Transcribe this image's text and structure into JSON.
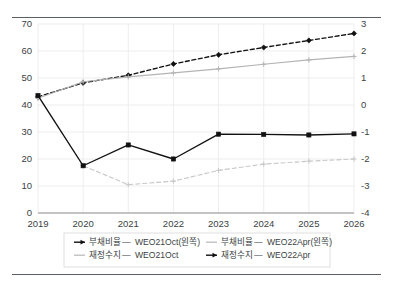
{
  "chart_data": {
    "type": "line",
    "title": "",
    "subtitle": "",
    "xlabel": "",
    "ylabel": "",
    "grid": true,
    "legend_position": "bottom",
    "categories": [
      "2019",
      "2020",
      "2021",
      "2022",
      "2023",
      "2024",
      "2025",
      "2026"
    ],
    "x": [
      2019,
      2020,
      2021,
      2022,
      2023,
      2024,
      2025,
      2026
    ],
    "left_axis": {
      "label": "",
      "ylim": [
        0,
        70
      ],
      "ticks": [
        "0",
        "10",
        "20",
        "30",
        "40",
        "50",
        "60",
        "70"
      ],
      "tick_values": [
        0,
        10,
        20,
        30,
        40,
        50,
        60,
        70
      ]
    },
    "right_axis": {
      "label": "",
      "ylim": [
        -4,
        3
      ],
      "ticks": [
        "-4",
        "-3",
        "-2",
        "-1",
        "0",
        "1",
        "2",
        "3"
      ],
      "tick_values": [
        -4,
        -3,
        -2,
        -1,
        0,
        1,
        2,
        3
      ]
    },
    "series": [
      {
        "name": "부채비율 WEO21Oct(왼쪽)",
        "axis": "left",
        "color": "#111111",
        "style": "dashed",
        "marker": "diamond",
        "values": [
          43.0,
          48.2,
          51.0,
          55.2,
          58.6,
          61.3,
          63.9,
          66.5
        ]
      },
      {
        "name": "부채비율 WEO22Apr(왼쪽)",
        "axis": "left",
        "color": "#b4b4b4",
        "style": "solid",
        "marker": "plus",
        "values": [
          42.5,
          48.6,
          50.4,
          51.9,
          53.4,
          55.1,
          56.7,
          58.0
        ]
      },
      {
        "name": "재정수지 WEO21Oct",
        "axis": "right",
        "color": "#c8c8c8",
        "style": "dashed",
        "marker": "plus",
        "values": [
          0.35,
          -2.25,
          -2.95,
          -2.82,
          -2.42,
          -2.19,
          -2.08,
          -2.0
        ]
      },
      {
        "name": "재정수지 WEO22Apr",
        "axis": "right",
        "color": "#111111",
        "style": "solid",
        "marker": "square",
        "values": [
          0.35,
          -2.25,
          -1.48,
          -2.0,
          -1.08,
          -1.09,
          -1.11,
          -1.07
        ]
      }
    ],
    "legend": [
      {
        "label_kr": "부채비율",
        "label_en": "WEO21Oct(왼쪽)",
        "marker": "arrow",
        "color": "#111111",
        "style": "solid"
      },
      {
        "label_kr": "부채비율",
        "label_en": "WEO22Apr(왼쪽)",
        "marker": "plus",
        "color": "#c0c0c0",
        "style": "solid"
      },
      {
        "label_kr": "재정수지",
        "label_en": "WEO21Oct",
        "marker": "dash",
        "color": "#c0c0c0",
        "style": "solid"
      },
      {
        "label_kr": "재정수지",
        "label_en": "WEO22Apr",
        "marker": "arrow",
        "color": "#111111",
        "style": "solid"
      }
    ]
  }
}
